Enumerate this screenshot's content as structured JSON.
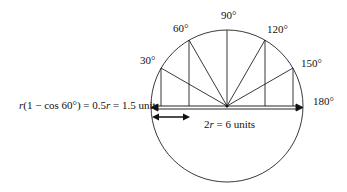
{
  "diagram": {
    "angle_labels": [
      "30°",
      "60°",
      "90°",
      "120°",
      "150°",
      "180°"
    ],
    "left_formula": {
      "r": "r",
      "rest1": "(1 − cos 60°) = 0.5",
      "r2": "r",
      "rest2": " = 1.5 unit"
    },
    "diameter_label": {
      "prefix": "2",
      "r": "r",
      "rest": " = 6 units"
    }
  }
}
